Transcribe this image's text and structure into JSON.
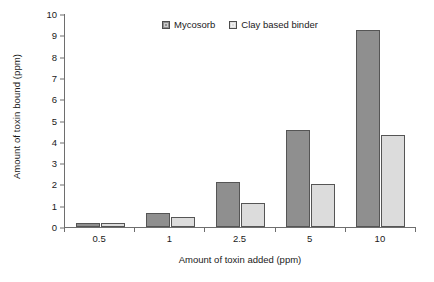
{
  "chart_data": {
    "type": "bar",
    "title": "",
    "subtitle": "",
    "xlabel": "Amount of toxin  added (ppm)",
    "ylabel": "Amount of toxin  bound (ppm)",
    "categories": [
      "0.5",
      "1",
      "2.5",
      "5",
      "10"
    ],
    "series": [
      {
        "name": "Mycosorb",
        "color": "#8f8f8f",
        "values": [
          0.2,
          0.65,
          2.1,
          4.55,
          9.25
        ]
      },
      {
        "name": "Clay based binder",
        "color": "#dcdcdc",
        "values": [
          0.2,
          0.45,
          1.15,
          2.0,
          4.3
        ]
      }
    ],
    "ylim": [
      0,
      10
    ],
    "ytick_labels": [
      "0",
      "1",
      "2",
      "3",
      "4",
      "5",
      "6",
      "7",
      "8",
      "9",
      "10"
    ],
    "ytick_values": [
      0,
      1,
      2,
      3,
      4,
      5,
      6,
      7,
      8,
      9,
      10
    ],
    "grid": false,
    "legend_position": "top-center",
    "axis_color": "#6e6e6e",
    "bar_border_color": "#555555"
  }
}
